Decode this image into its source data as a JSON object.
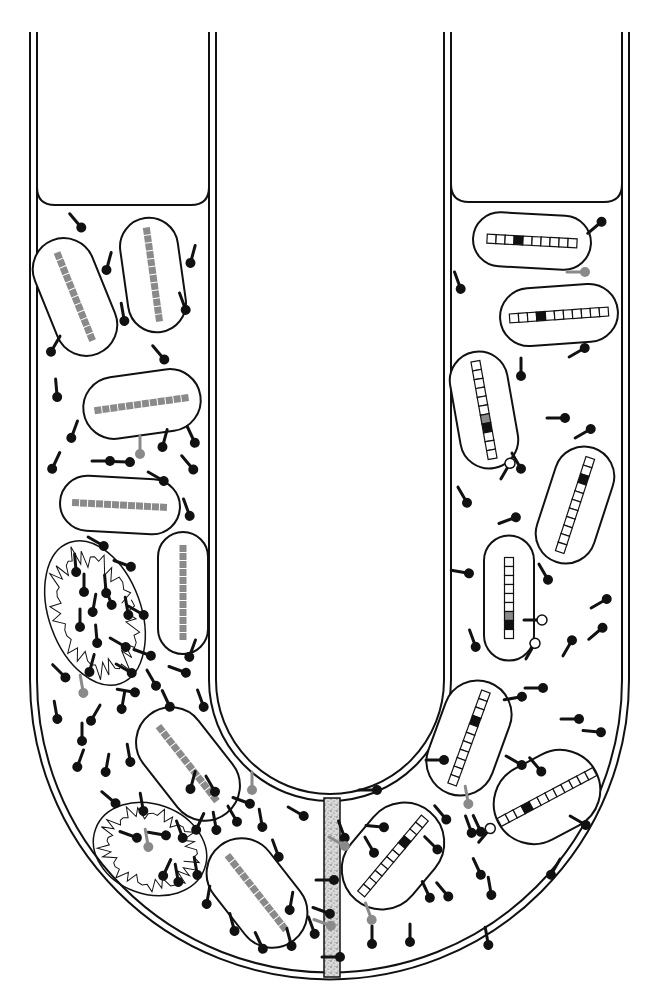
{
  "figure": {
    "title": "U-tube experiment: bacterial cells in two arms separated by a filter",
    "canvas": {
      "width": 660,
      "height": 1007
    },
    "colors": {
      "ink": "#111111",
      "gray": "#8a8a8a",
      "filter_fill": "#cfcfcf",
      "background": "#ffffff",
      "empty_square": "#ffffff",
      "marked_square": "#111111"
    }
  },
  "tube": {
    "outer_left_x": 30,
    "inner_left_x": 37,
    "outer_right_x": 629,
    "inner_right_x": 622,
    "top_y": 32,
    "arm_inner_left_x": 216,
    "arm_inner_right_x": 444,
    "arm_inner_wall_left_x": 209,
    "arm_inner_wall_right_x": 451,
    "bend_center_y": 680,
    "liquid_level_left_y": 205,
    "liquid_level_right_y": 202
  },
  "filter": {
    "label": "filter",
    "x": 324,
    "y1": 798,
    "y2": 977,
    "width": 16
  },
  "left_arm": {
    "label": "donor-culture",
    "cells": [
      {
        "cx": 75,
        "cy": 297,
        "w": 62,
        "h": 122,
        "rot": -22,
        "squares": 12,
        "type": "gray"
      },
      {
        "cx": 153,
        "cy": 275,
        "w": 58,
        "h": 115,
        "rot": -8,
        "squares": 12,
        "type": "gray"
      },
      {
        "cx": 142,
        "cy": 404,
        "w": 118,
        "h": 62,
        "rot": -8,
        "squares": 12,
        "type": "gray"
      },
      {
        "cx": 120,
        "cy": 505,
        "w": 120,
        "h": 55,
        "rot": 3,
        "squares": 12,
        "type": "gray"
      },
      {
        "cx": 183,
        "cy": 593,
        "w": 50,
        "h": 122,
        "rot": 0,
        "squares": 12,
        "type": "gray"
      },
      {
        "cx": 188,
        "cy": 764,
        "w": 70,
        "h": 125,
        "rot": -38,
        "squares": 12,
        "type": "gray"
      },
      {
        "cx": 257,
        "cy": 893,
        "w": 70,
        "h": 120,
        "rot": -38,
        "squares": 12,
        "type": "gray"
      }
    ],
    "lysed_cells": [
      {
        "cx": 95,
        "cy": 613,
        "rx": 46,
        "ry": 75,
        "rot": -20
      },
      {
        "cx": 150,
        "cy": 849,
        "rx": 58,
        "ry": 45,
        "rot": 20
      }
    ]
  },
  "right_arm": {
    "label": "recipient-culture",
    "cells": [
      {
        "cx": 532,
        "cy": 241,
        "w": 118,
        "h": 54,
        "rot": 3,
        "squares": 10,
        "marked": 3,
        "type": "boxed"
      },
      {
        "cx": 559,
        "cy": 315,
        "w": 118,
        "h": 58,
        "rot": -4,
        "squares": 11,
        "marked": 3,
        "type": "boxed"
      },
      {
        "cx": 484,
        "cy": 410,
        "w": 58,
        "h": 118,
        "rot": -10,
        "squares": 11,
        "marked": 7,
        "gray_marked": 6,
        "type": "boxed"
      },
      {
        "cx": 575,
        "cy": 505,
        "w": 60,
        "h": 120,
        "rot": 18,
        "squares": 11,
        "marked": 2,
        "type": "boxed"
      },
      {
        "cx": 509,
        "cy": 598,
        "w": 50,
        "h": 125,
        "rot": 0,
        "squares": 9,
        "marked": 7,
        "gray_marked": 6,
        "type": "boxed"
      },
      {
        "cx": 469,
        "cy": 738,
        "w": 68,
        "h": 118,
        "rot": 20,
        "squares": 11,
        "marked": 3,
        "type": "boxed"
      },
      {
        "cx": 547,
        "cy": 797,
        "w": 110,
        "h": 80,
        "rot": -28,
        "squares": 12,
        "marked": 3,
        "type": "boxed"
      },
      {
        "cx": 393,
        "cy": 856,
        "w": 80,
        "h": 115,
        "rot": 40,
        "squares": 11,
        "marked": 3,
        "type": "boxed"
      }
    ]
  },
  "phages": {
    "black": [
      [
        80,
        226,
        -40
      ],
      [
        107,
        268,
        15
      ],
      [
        191,
        261,
        15
      ],
      [
        124,
        319,
        -10
      ],
      [
        185,
        308,
        -20
      ],
      [
        52,
        350,
        30
      ],
      [
        163,
        358,
        -40
      ],
      [
        57,
        395,
        -5
      ],
      [
        72,
        436,
        20
      ],
      [
        108,
        461,
        -90
      ],
      [
        128,
        462,
        -88
      ],
      [
        194,
        441,
        -25
      ],
      [
        163,
        445,
        15
      ],
      [
        53,
        467,
        25
      ],
      [
        192,
        468,
        -40
      ],
      [
        162,
        480,
        -60
      ],
      [
        189,
        514,
        -20
      ],
      [
        102,
        545,
        -60
      ],
      [
        129,
        566,
        -70
      ],
      [
        76,
        570,
        -5
      ],
      [
        84,
        590,
        0
      ],
      [
        106,
        591,
        -5
      ],
      [
        93,
        610,
        10
      ],
      [
        80,
        625,
        0
      ],
      [
        97,
        641,
        -5
      ],
      [
        111,
        603,
        -20
      ],
      [
        128,
        613,
        -10
      ],
      [
        142,
        614,
        -60
      ],
      [
        124,
        646,
        -60
      ],
      [
        149,
        655,
        -70
      ],
      [
        64,
        676,
        -45
      ],
      [
        90,
        670,
        15
      ],
      [
        130,
        672,
        -60
      ],
      [
        155,
        684,
        -30
      ],
      [
        184,
        672,
        -70
      ],
      [
        190,
        655,
        20
      ],
      [
        57,
        717,
        -10
      ],
      [
        92,
        719,
        30
      ],
      [
        122,
        707,
        10
      ],
      [
        133,
        692,
        -80
      ],
      [
        169,
        705,
        -25
      ],
      [
        203,
        705,
        -20
      ],
      [
        82,
        739,
        0
      ],
      [
        106,
        770,
        10
      ],
      [
        130,
        760,
        -10
      ],
      [
        78,
        765,
        20
      ],
      [
        114,
        802,
        -50
      ],
      [
        143,
        809,
        -10
      ],
      [
        214,
        790,
        -30
      ],
      [
        191,
        787,
        15
      ],
      [
        135,
        837,
        -70
      ],
      [
        164,
        835,
        -80
      ],
      [
        182,
        836,
        -20
      ],
      [
        197,
        828,
        25
      ],
      [
        216,
        828,
        -10
      ],
      [
        236,
        820,
        -30
      ],
      [
        164,
        874,
        25
      ],
      [
        178,
        880,
        -10
      ],
      [
        197,
        873,
        -10
      ],
      [
        207,
        902,
        10
      ],
      [
        234,
        929,
        -15
      ],
      [
        262,
        947,
        -25
      ],
      [
        248,
        803,
        -70
      ],
      [
        262,
        825,
        -10
      ],
      [
        278,
        855,
        -20
      ],
      [
        290,
        908,
        10
      ],
      [
        314,
        932,
        -20
      ],
      [
        291,
        944,
        -15
      ],
      [
        302,
        815,
        -60
      ],
      [
        332,
        880,
        -90
      ],
      [
        328,
        913,
        -70
      ],
      [
        338,
        957,
        -90
      ],
      [
        344,
        836,
        -20
      ],
      [
        375,
        790,
        -90
      ],
      [
        382,
        827,
        -85
      ],
      [
        373,
        851,
        -30
      ],
      [
        436,
        848,
        -45
      ],
      [
        445,
        818,
        -40
      ],
      [
        480,
        830,
        -25
      ],
      [
        480,
        873,
        -25
      ],
      [
        491,
        893,
        -10
      ],
      [
        447,
        895,
        -40
      ],
      [
        429,
        896,
        -25
      ],
      [
        410,
        940,
        0
      ],
      [
        372,
        942,
        0
      ],
      [
        488,
        943,
        -10
      ],
      [
        552,
        873,
        30
      ],
      [
        584,
        824,
        -60
      ],
      [
        605,
        600,
        -120
      ],
      [
        571,
        642,
        -150
      ],
      [
        541,
        688,
        -90
      ],
      [
        520,
        697,
        -100
      ],
      [
        520,
        764,
        -60
      ],
      [
        540,
        770,
        -40
      ],
      [
        577,
        719,
        -90
      ],
      [
        599,
        732,
        -85
      ],
      [
        601,
        629,
        -130
      ],
      [
        475,
        645,
        -20
      ],
      [
        442,
        760,
        -90
      ],
      [
        467,
        573,
        -80
      ],
      [
        514,
        518,
        -110
      ],
      [
        547,
        578,
        -30
      ],
      [
        563,
        418,
        -90
      ],
      [
        589,
        430,
        -120
      ],
      [
        466,
        501,
        -30
      ],
      [
        520,
        467,
        -30
      ],
      [
        521,
        374,
        0
      ],
      [
        583,
        349,
        -120
      ],
      [
        600,
        223,
        -130
      ],
      [
        460,
        287,
        -20
      ],
      [
        471,
        831,
        -20
      ]
    ],
    "gray": [
      [
        140,
        452,
        0
      ],
      [
        83,
        691,
        -10
      ],
      [
        252,
        788,
        0
      ],
      [
        148,
        845,
        -10
      ],
      [
        468,
        802,
        -10
      ],
      [
        371,
        918,
        -20
      ],
      [
        343,
        845,
        -60
      ],
      [
        329,
        925,
        -70
      ],
      [
        583,
        272,
        -90
      ]
    ],
    "attached_hollow": [
      [
        509,
        465,
        -150
      ],
      [
        534,
        645,
        -150
      ],
      [
        540,
        620,
        -90
      ],
      [
        489,
        830,
        -140
      ]
    ]
  }
}
